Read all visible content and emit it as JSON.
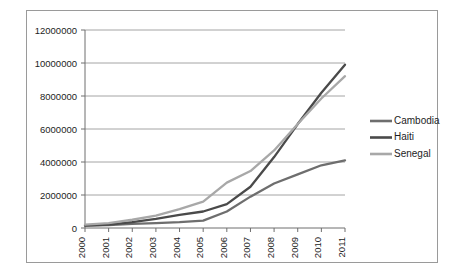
{
  "chart_data": {
    "type": "line",
    "title": "",
    "subtitle": "",
    "xlabel": "",
    "ylabel": "",
    "x": [
      2000,
      2001,
      2002,
      2003,
      2004,
      2005,
      2006,
      2007,
      2008,
      2009,
      2010,
      2011
    ],
    "categories": [
      "2000",
      "2001",
      "2002",
      "2003",
      "2004",
      "2005",
      "2006",
      "2007",
      "2008",
      "2009",
      "2010",
      "2011"
    ],
    "series": [
      {
        "name": "Cambodia",
        "color": "#6e6e6e",
        "values": [
          150000,
          180000,
          250000,
          300000,
          350000,
          450000,
          1000000,
          1900000,
          2700000,
          3250000,
          3800000,
          4100000
        ]
      },
      {
        "name": "Haiti",
        "color": "#4a4a4a",
        "values": [
          150000,
          200000,
          350000,
          550000,
          800000,
          1000000,
          1450000,
          2500000,
          4300000,
          6300000,
          8200000,
          9900000
        ]
      },
      {
        "name": "Senegal",
        "color": "#a8a8a8",
        "values": [
          200000,
          300000,
          500000,
          750000,
          1150000,
          1600000,
          2750000,
          3450000,
          4700000,
          6300000,
          7850000,
          9200000
        ]
      }
    ],
    "ylim": [
      0,
      12000000
    ],
    "ytick_values": [
      0,
      2000000,
      4000000,
      6000000,
      8000000,
      10000000,
      12000000
    ],
    "ytick_labels": [
      "0",
      "2000000",
      "4000000",
      "6000000",
      "8000000",
      "10000000",
      "12000000"
    ],
    "xlim": [
      2000,
      2011
    ],
    "grid": "horizontal",
    "xtick_label_rotation": -90,
    "legend": {
      "position": "right",
      "entries": [
        {
          "label": "Cambodia",
          "color": "#6e6e6e"
        },
        {
          "label": "Haiti",
          "color": "#4a4a4a"
        },
        {
          "label": "Senegal",
          "color": "#a8a8a8"
        }
      ]
    },
    "colors": {
      "background": "#ffffff",
      "grid": "#8d8d8d",
      "axis": "#6f6f6f",
      "text": "#1d1d1d",
      "frame": "#9a9a9a"
    }
  }
}
